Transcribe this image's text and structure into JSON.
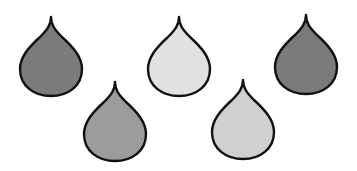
{
  "scene": {
    "background": "#ffffff",
    "stroke_color": "#111111",
    "drops": [
      {
        "id": "drop-1",
        "shade": "dark-gray",
        "fill": "#7b7b7b",
        "x": 18,
        "y": 16
      },
      {
        "id": "drop-2",
        "shade": "light-gray",
        "fill": "#e1e1e1",
        "x": 146,
        "y": 16
      },
      {
        "id": "drop-3",
        "shade": "dark-gray",
        "fill": "#7b7b7b",
        "x": 273,
        "y": 14
      },
      {
        "id": "drop-4",
        "shade": "medium-gray",
        "fill": "#9c9c9c",
        "x": 82,
        "y": 81
      },
      {
        "id": "drop-5",
        "shade": "light-medium-gray",
        "fill": "#d0d0d0",
        "x": 210,
        "y": 79
      }
    ]
  }
}
